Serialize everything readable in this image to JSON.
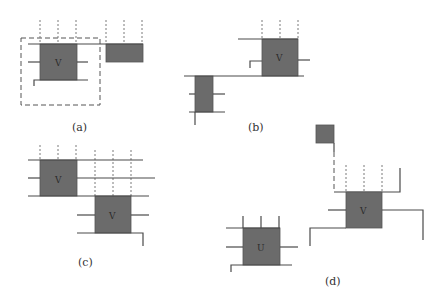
{
  "figure": {
    "panels": [
      {
        "id": "a",
        "label": "(a)",
        "box_labels": [
          "V"
        ]
      },
      {
        "id": "b",
        "label": "(b)",
        "box_labels": [
          "V"
        ]
      },
      {
        "id": "c",
        "label": "(c)",
        "box_labels": [
          "V",
          "V"
        ]
      },
      {
        "id": "d",
        "label": "(d)",
        "box_labels": [
          "V",
          "U"
        ]
      }
    ]
  },
  "colors": {
    "box_fill": "#6b6b6b",
    "line": "#4a4a4a",
    "background": "#ffffff"
  }
}
